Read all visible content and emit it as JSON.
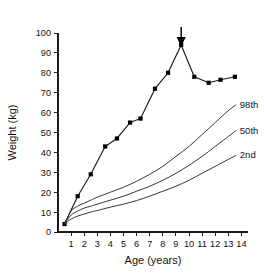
{
  "chart_data": {
    "type": "line",
    "title": "",
    "xlabel": "Age (years)",
    "ylabel": "Weight (kg)",
    "xlim": [
      0,
      14.5
    ],
    "ylim": [
      0,
      100
    ],
    "xticks": [
      1,
      2,
      3,
      4,
      5,
      6,
      7,
      8,
      9,
      10,
      11,
      12,
      13,
      14
    ],
    "yticks": [
      0,
      10,
      20,
      30,
      40,
      50,
      60,
      70,
      80,
      90,
      100
    ],
    "grid": false,
    "legend_position": "inline-right-end-of-curve",
    "series": [
      {
        "name": "patient-weight",
        "style": "line-with-square-markers",
        "markers": true,
        "x": [
          0.5,
          1.5,
          2.5,
          3.6,
          4.5,
          5.5,
          6.3,
          7.4,
          8.4,
          9.4,
          10.4,
          11.5,
          12.4,
          13.5
        ],
        "values": [
          4,
          18,
          29,
          43,
          47,
          55,
          57,
          72,
          80,
          94,
          78,
          75,
          76.5,
          78
        ]
      },
      {
        "name": "98th",
        "style": "reference-centile",
        "markers": false,
        "x": [
          0.5,
          1,
          1.5,
          2,
          2.5,
          3,
          4,
          5,
          6,
          7,
          8,
          9,
          10,
          11,
          12,
          13,
          13.6
        ],
        "values": [
          4,
          10.5,
          13,
          14.5,
          16,
          17.5,
          20,
          22.5,
          25.5,
          29,
          33,
          38,
          43,
          49,
          55,
          61,
          64
        ]
      },
      {
        "name": "50th",
        "style": "reference-centile",
        "markers": false,
        "x": [
          0.5,
          1,
          1.5,
          2,
          2.5,
          3,
          4,
          5,
          6,
          7,
          8,
          9,
          10,
          11,
          12,
          13,
          13.6
        ],
        "values": [
          4,
          8.5,
          10.5,
          12,
          13,
          14,
          16,
          18,
          20.5,
          23,
          26,
          29.5,
          33.5,
          38,
          43,
          48,
          51
        ]
      },
      {
        "name": "2nd",
        "style": "reference-centile",
        "markers": false,
        "x": [
          0.5,
          1,
          1.5,
          2,
          2.5,
          3,
          4,
          5,
          6,
          7,
          8,
          9,
          10,
          11,
          12,
          13,
          13.6
        ],
        "values": [
          4,
          6.5,
          8,
          9,
          10,
          10.8,
          12.5,
          14,
          15.8,
          18,
          20.5,
          23,
          26,
          29.5,
          33,
          36.5,
          38.5
        ]
      }
    ],
    "series_labels": [
      {
        "text": "98th",
        "x": 13.8,
        "y": 64
      },
      {
        "text": "50th",
        "x": 13.8,
        "y": 51
      },
      {
        "text": "2nd",
        "x": 13.8,
        "y": 38.5
      }
    ],
    "annotations": [
      {
        "name": "peak-arrow",
        "type": "down-arrow",
        "x": 9.4,
        "y_from": 103,
        "y_to": 98,
        "points_at_value": 94
      }
    ]
  }
}
